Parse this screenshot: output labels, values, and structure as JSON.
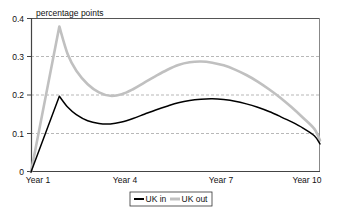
{
  "chart_data": {
    "type": "line",
    "title": "percentage points",
    "xlabel": "",
    "ylabel": "",
    "ylim": [
      0,
      0.4
    ],
    "xlim": [
      0,
      10.2
    ],
    "grid": true,
    "grid_values": [
      0.1,
      0.2,
      0.3
    ],
    "legend_position": "bottom",
    "y_ticks": [
      "0",
      "0.1",
      "0.2",
      "0.3",
      "0.4"
    ],
    "y_tick_values": [
      0,
      0.1,
      0.2,
      0.3,
      0.4
    ],
    "x_ticks": [
      "Year 1",
      "Year 4",
      "Year 7",
      "Year 10"
    ],
    "x_tick_values": [
      1,
      4,
      7,
      10
    ],
    "series": [
      {
        "name": "UK in",
        "color": "#000000",
        "width": 1.5,
        "x": [
          0.0,
          1.0,
          1.3,
          1.6,
          2.0,
          2.4,
          2.8,
          3.2,
          3.6,
          4.0,
          4.4,
          4.8,
          5.2,
          5.6,
          6.0,
          6.4,
          6.8,
          7.2,
          7.6,
          8.0,
          8.4,
          8.8,
          9.2,
          9.6,
          10.0,
          10.2
        ],
        "y": [
          0.0,
          0.197,
          0.168,
          0.149,
          0.133,
          0.126,
          0.125,
          0.13,
          0.139,
          0.15,
          0.161,
          0.171,
          0.18,
          0.186,
          0.189,
          0.19,
          0.188,
          0.184,
          0.177,
          0.168,
          0.157,
          0.144,
          0.13,
          0.114,
          0.094,
          0.073
        ]
      },
      {
        "name": "UK out",
        "color": "#c0c0c0",
        "width": 2.6,
        "x": [
          0.0,
          1.0,
          1.3,
          1.6,
          2.0,
          2.4,
          2.8,
          3.2,
          3.6,
          4.0,
          4.4,
          4.8,
          5.2,
          5.6,
          6.0,
          6.4,
          6.8,
          7.2,
          7.6,
          8.0,
          8.4,
          8.8,
          9.2,
          9.6,
          10.0,
          10.2
        ],
        "y": [
          0.0,
          0.378,
          0.305,
          0.263,
          0.228,
          0.207,
          0.198,
          0.202,
          0.215,
          0.232,
          0.249,
          0.265,
          0.278,
          0.285,
          0.287,
          0.284,
          0.277,
          0.266,
          0.252,
          0.235,
          0.215,
          0.193,
          0.168,
          0.141,
          0.112,
          0.082
        ]
      }
    ],
    "legend_entries": [
      {
        "label": "UK in",
        "color": "#000000",
        "width": 2.0
      },
      {
        "label": "UK out",
        "color": "#c0c0c0",
        "width": 3.0
      }
    ]
  },
  "axis": {
    "title": "percentage points",
    "y_labels": [
      "0.4",
      "0.3",
      "0.2",
      "0.1",
      "0"
    ],
    "x_labels": [
      "Year 1",
      "Year 4",
      "Year 7",
      "Year 10"
    ]
  },
  "legend": {
    "items": [
      "UK in",
      "UK out"
    ]
  }
}
